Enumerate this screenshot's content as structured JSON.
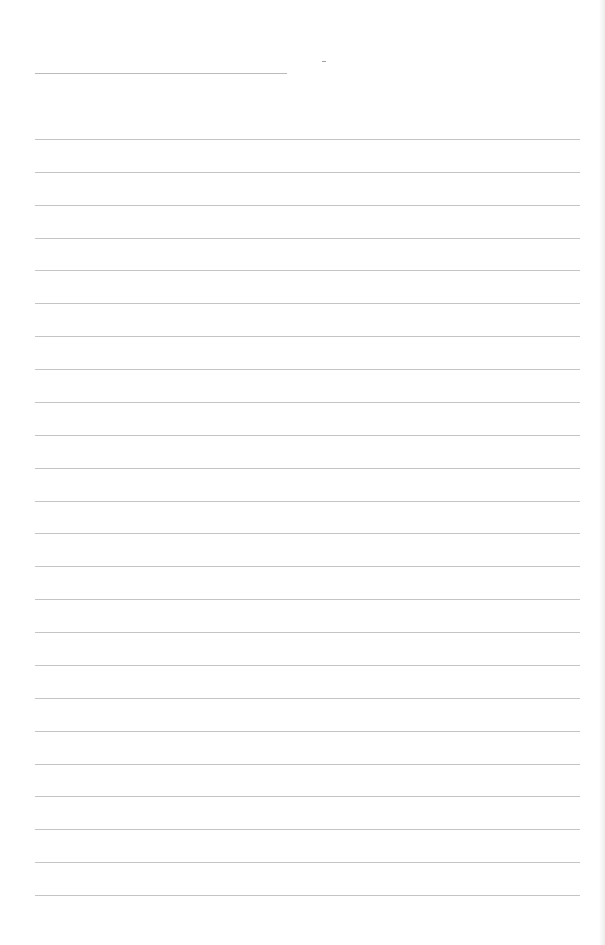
{
  "page": {
    "type": "blank-lined-paper",
    "background_color": "#ffffff",
    "line_color": "#c4c4c4"
  },
  "header": {
    "line": {
      "x": 35,
      "y": 73,
      "width": 252
    },
    "mark": {
      "x": 322,
      "y": 61
    }
  },
  "ruled_lines": {
    "count": 24,
    "start_y": 139,
    "spacing": 32.87,
    "x": 35,
    "width": 545
  }
}
